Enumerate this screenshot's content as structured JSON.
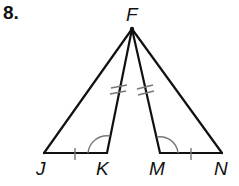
{
  "problem": {
    "number": "8.",
    "points": {
      "F": {
        "label": "F",
        "x": 132,
        "y": 29
      },
      "J": {
        "label": "J",
        "x": 44,
        "y": 153
      },
      "K": {
        "label": "K",
        "x": 107,
        "y": 153
      },
      "M": {
        "label": "M",
        "x": 160,
        "y": 153
      },
      "N": {
        "label": "N",
        "x": 222,
        "y": 153
      }
    },
    "segments": [
      "FJ",
      "FK",
      "FM",
      "FN",
      "JK",
      "MN"
    ],
    "congruence_marks": {
      "single_tick": [
        "JK",
        "MN"
      ],
      "double_tick": [
        "FK",
        "FM"
      ],
      "angle_arcs": [
        "FKJ",
        "FMN"
      ]
    },
    "colors": {
      "stroke": "#111111",
      "marks": "#777777"
    }
  }
}
